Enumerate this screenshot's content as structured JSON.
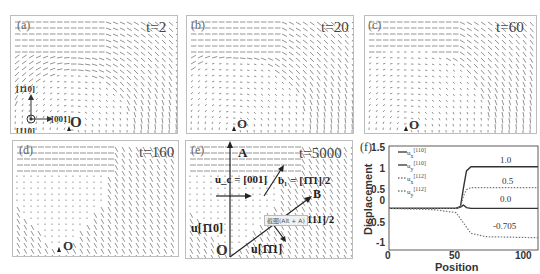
{
  "panels": [
    {
      "id": "a",
      "label": "(a)",
      "time": "t=2",
      "origin": "O",
      "axes": {
        "up": "[1̄10]",
        "right": "[001]",
        "out": "[110]"
      }
    },
    {
      "id": "b",
      "label": "(b)",
      "time": "t=20",
      "origin": "O"
    },
    {
      "id": "c",
      "label": "(c)",
      "time": "t=60",
      "origin": "O"
    },
    {
      "id": "d",
      "label": "(d)",
      "time": "t=160",
      "origin": "O"
    },
    {
      "id": "e",
      "label": "(e)",
      "time": "t=5000",
      "origin": "O",
      "annotations": {
        "point_A": "A",
        "point_B": "B",
        "u_c": "u_c = [001]",
        "b1": "b₁ = [1̄1̄1]/2",
        "b2": "b₂ = [111]/2",
        "u_110": "u[1̄10]",
        "u_111": "u[1̄1̄1]",
        "tooltip": "截图(Alt + A)"
      }
    }
  ],
  "chart_data": {
    "type": "line",
    "panel_label": "(f)",
    "title": "",
    "xlabel": "Position",
    "ylabel": "Displacement",
    "xlim": [
      0,
      100
    ],
    "ylim": [
      -1,
      1.5
    ],
    "xticks": [
      0,
      50,
      100
    ],
    "yticks": [
      1.5,
      1,
      0.5,
      0,
      -0.5,
      -1
    ],
    "ytick_labels": [
      "1.5",
      "1",
      "0.5",
      "0",
      "-0.5",
      "-1"
    ],
    "grid": false,
    "legend_position": "upper left",
    "legend": [
      "u_x^[110]",
      "u_y^[110]",
      "u_x^[112]",
      "u_y^[112]"
    ],
    "series": [
      {
        "name": "u_x^[110]",
        "style": "solid",
        "x": [
          0,
          45,
          48,
          50,
          52,
          55,
          100
        ],
        "y": [
          0,
          0,
          0.05,
          0.5,
          0.9,
          1.0,
          1.0
        ],
        "final_label": "1.0"
      },
      {
        "name": "u_y^[110]",
        "style": "solid",
        "x": [
          0,
          45,
          48,
          50,
          52,
          55,
          100
        ],
        "y": [
          0,
          0,
          0.03,
          0.08,
          0.02,
          0,
          0
        ],
        "final_label": "0.0"
      },
      {
        "name": "u_x^[112]",
        "style": "dotted",
        "x": [
          0,
          45,
          48,
          50,
          52,
          55,
          100
        ],
        "y": [
          0,
          0,
          0.03,
          0.3,
          0.45,
          0.5,
          0.5
        ],
        "final_label": "0.5"
      },
      {
        "name": "u_y^[112]",
        "style": "dotted",
        "x": [
          0,
          30,
          45,
          50,
          55,
          65,
          100
        ],
        "y": [
          0,
          -0.03,
          -0.1,
          -0.35,
          -0.6,
          -0.68,
          -0.705
        ],
        "final_label": "-0.705"
      }
    ],
    "annotations": [
      "1.0",
      "0.5",
      "0.0",
      "-0.705"
    ]
  },
  "chart_labels": {
    "panel": "(f)",
    "x_title": "Position",
    "y_title": "Displacement",
    "legend": {
      "l1": "u",
      "l1s": "x",
      "l1p": "[110]",
      "l2": "u",
      "l2s": "y",
      "l2p": "[110]",
      "l3": "u",
      "l3s": "x",
      "l3p": "[112]",
      "l4": "u",
      "l4s": "y",
      "l4p": "[112]"
    },
    "yt": [
      "1.5",
      "1",
      "0.5",
      "0",
      "-0.5",
      "-1"
    ],
    "xt": [
      "0",
      "50",
      "100"
    ],
    "v1": "1.0",
    "v2": "0.5",
    "v3": "0.0",
    "v4": "-0.705"
  }
}
